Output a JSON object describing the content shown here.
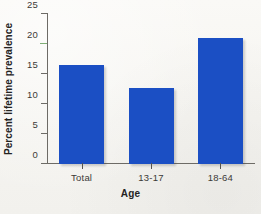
{
  "chart_data": {
    "type": "bar",
    "title": "",
    "subtitle": "",
    "categories": [
      "Total",
      "13-17",
      "18-64"
    ],
    "values": [
      16.5,
      12.75,
      21.0
    ],
    "xlabel": "Age",
    "ylabel": "Percent lifetime prevalence",
    "ylim": [
      0,
      25
    ],
    "yticks": [
      0,
      5,
      10,
      15,
      20,
      25
    ],
    "ytick_labels": [
      "0",
      "5",
      "10",
      "15",
      "20",
      "25"
    ],
    "grid": false,
    "legend": null,
    "bar_color": "#1b4fc4",
    "axis_color": "#6d6b66",
    "background_color": "#f7f6f2",
    "accent_tick_color": "#7fae76",
    "accent_tick_value": 20
  }
}
